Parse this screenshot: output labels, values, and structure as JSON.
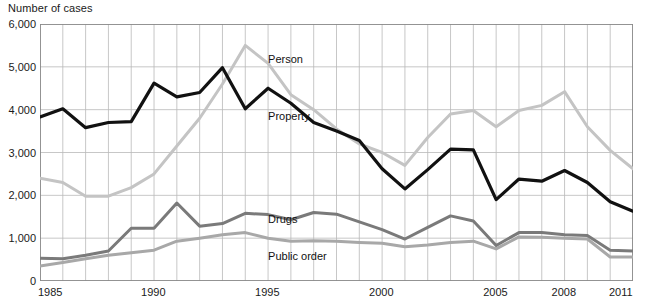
{
  "header": {
    "y_axis_title": "Number of cases"
  },
  "chart_data": {
    "type": "line",
    "title": "",
    "xlabel": "",
    "ylabel": "Number of cases",
    "xlim": [
      1985,
      2011
    ],
    "ylim": [
      0,
      6000
    ],
    "grid": true,
    "legend_position": "inline-annotations",
    "y_ticks": [
      0,
      1000,
      2000,
      3000,
      4000,
      5000,
      6000
    ],
    "y_tick_labels": [
      "0",
      "1,000",
      "2,000",
      "3,000",
      "4,000",
      "5,000",
      "6,000"
    ],
    "x_ticks": [
      1985,
      1990,
      1995,
      2000,
      2005,
      2008,
      2011
    ],
    "x_tick_labels": [
      "1985",
      "1990",
      "1995",
      "2000",
      "2005",
      "2008",
      "2011"
    ],
    "x": [
      1985,
      1986,
      1987,
      1988,
      1989,
      1990,
      1991,
      1992,
      1993,
      1994,
      1995,
      1996,
      1997,
      1998,
      1999,
      2000,
      2001,
      2002,
      2003,
      2004,
      2005,
      2006,
      2007,
      2008,
      2009,
      2010,
      2011
    ],
    "series": [
      {
        "name": "Person",
        "color": "#c4c4c4",
        "label_x": 1995,
        "label_y": 5150,
        "values": [
          2400,
          2300,
          1980,
          1980,
          2180,
          2500,
          3150,
          3800,
          4600,
          5500,
          5080,
          4350,
          4000,
          3550,
          3200,
          3000,
          2700,
          3350,
          3900,
          3980,
          3600,
          3980,
          4100,
          4420,
          3600,
          3050,
          2620
        ]
      },
      {
        "name": "Property",
        "color": "#111111",
        "label_x": 1995,
        "label_y": 3820,
        "values": [
          3830,
          4020,
          3580,
          3700,
          3720,
          4620,
          4300,
          4400,
          4980,
          4020,
          4500,
          4150,
          3700,
          3500,
          3280,
          2620,
          2150,
          2600,
          3080,
          3060,
          1900,
          2380,
          2330,
          2580,
          2300,
          1850,
          1630
        ]
      },
      {
        "name": "Drugs",
        "color": "#7a7a7a",
        "label_x": 1995,
        "label_y": 1420,
        "values": [
          530,
          520,
          600,
          700,
          1230,
          1230,
          1820,
          1280,
          1340,
          1580,
          1550,
          1430,
          1600,
          1560,
          1380,
          1200,
          980,
          1250,
          1520,
          1400,
          830,
          1130,
          1130,
          1080,
          1060,
          720,
          700
        ]
      },
      {
        "name": "Public order",
        "color": "#a8a8a8",
        "label_x": 1995,
        "label_y": 560,
        "values": [
          350,
          430,
          520,
          600,
          660,
          720,
          930,
          1000,
          1080,
          1130,
          1000,
          930,
          940,
          930,
          900,
          880,
          800,
          840,
          900,
          930,
          750,
          1030,
          1020,
          1000,
          980,
          560,
          560
        ]
      }
    ]
  }
}
